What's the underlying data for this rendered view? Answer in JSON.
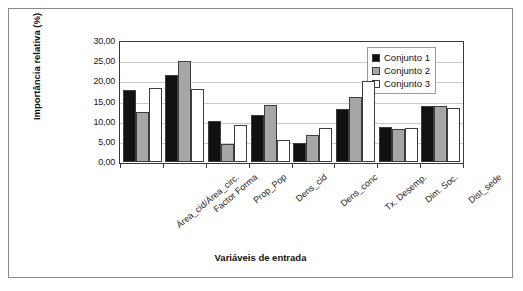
{
  "chart_data": {
    "type": "bar",
    "title": "",
    "xlabel": "Variáveis de entrada",
    "ylabel": "Importância relativa (%)",
    "ylim": [
      0,
      30
    ],
    "ytick_values": [
      0,
      5,
      10,
      15,
      20,
      25,
      30
    ],
    "ytick_labels": [
      "0,00",
      "5,00",
      "10,00",
      "15,00",
      "20,00",
      "25,00",
      "30,00"
    ],
    "grid": true,
    "legend_position": "top-right",
    "categories": [
      "Área_cid/Área_circ.",
      "Factor Forma",
      "Prop_Pop",
      "Dens_cid",
      "Dens_conc",
      "Tx. Desemp.",
      "Dim. Soc.",
      "Dist_sede"
    ],
    "series": [
      {
        "name": "Conjunto 1",
        "color": "#111111",
        "values": [
          17.8,
          21.5,
          10.1,
          11.7,
          4.6,
          13.1,
          8.6,
          14.0
        ]
      },
      {
        "name": "Conjunto 2",
        "color": "#a6a6a6",
        "values": [
          12.5,
          25.0,
          4.4,
          14.1,
          6.8,
          16.2,
          8.2,
          13.9
        ]
      },
      {
        "name": "Conjunto 3",
        "color": "#ffffff",
        "values": [
          18.3,
          18.0,
          9.1,
          5.5,
          8.5,
          20.0,
          8.5,
          13.5
        ]
      }
    ]
  }
}
